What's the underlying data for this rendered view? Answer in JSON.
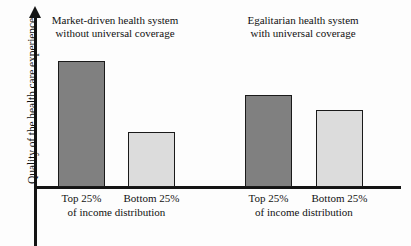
{
  "chart_data": {
    "type": "bar",
    "title": "",
    "subtitle": "",
    "xlabel": "",
    "ylabel": "Quality of the health care experience",
    "grid": false,
    "legend": "none",
    "axis_arrow": true,
    "ylim": [
      0,
      140
    ],
    "categories": [
      "Top 25%",
      "Bottom 25%"
    ],
    "group_sublabel": "of income distribution",
    "groups": [
      {
        "name": "Market-driven health system without universal coverage",
        "heading_line1": "Market-driven health system",
        "heading_line2": "without universal coverage",
        "bars": [
          {
            "category": "Top 25%",
            "value": 126,
            "fill": "#808080"
          },
          {
            "category": "Bottom 25%",
            "value": 55,
            "fill": "#dcdcdc"
          }
        ]
      },
      {
        "name": "Egalitarian health system with universal coverage",
        "heading_line1": "Egalitarian health system",
        "heading_line2": "with universal coverage",
        "bars": [
          {
            "category": "Top 25%",
            "value": 92,
            "fill": "#808080"
          },
          {
            "category": "Bottom 25%",
            "value": 77,
            "fill": "#dcdcdc"
          }
        ]
      }
    ],
    "series": [
      {
        "name": "Top 25% of income distribution",
        "values": [
          126,
          92
        ],
        "fill": "#808080"
      },
      {
        "name": "Bottom 25% of income distribution",
        "values": [
          55,
          77
        ],
        "fill": "#dcdcdc"
      }
    ],
    "colors": {
      "top_quartile_bar": "#808080",
      "bottom_quartile_bar": "#dcdcdc",
      "bar_outline": "#1a1a1a",
      "axis": "#141414",
      "background": "#fdfdfd",
      "text": "#111111"
    }
  }
}
